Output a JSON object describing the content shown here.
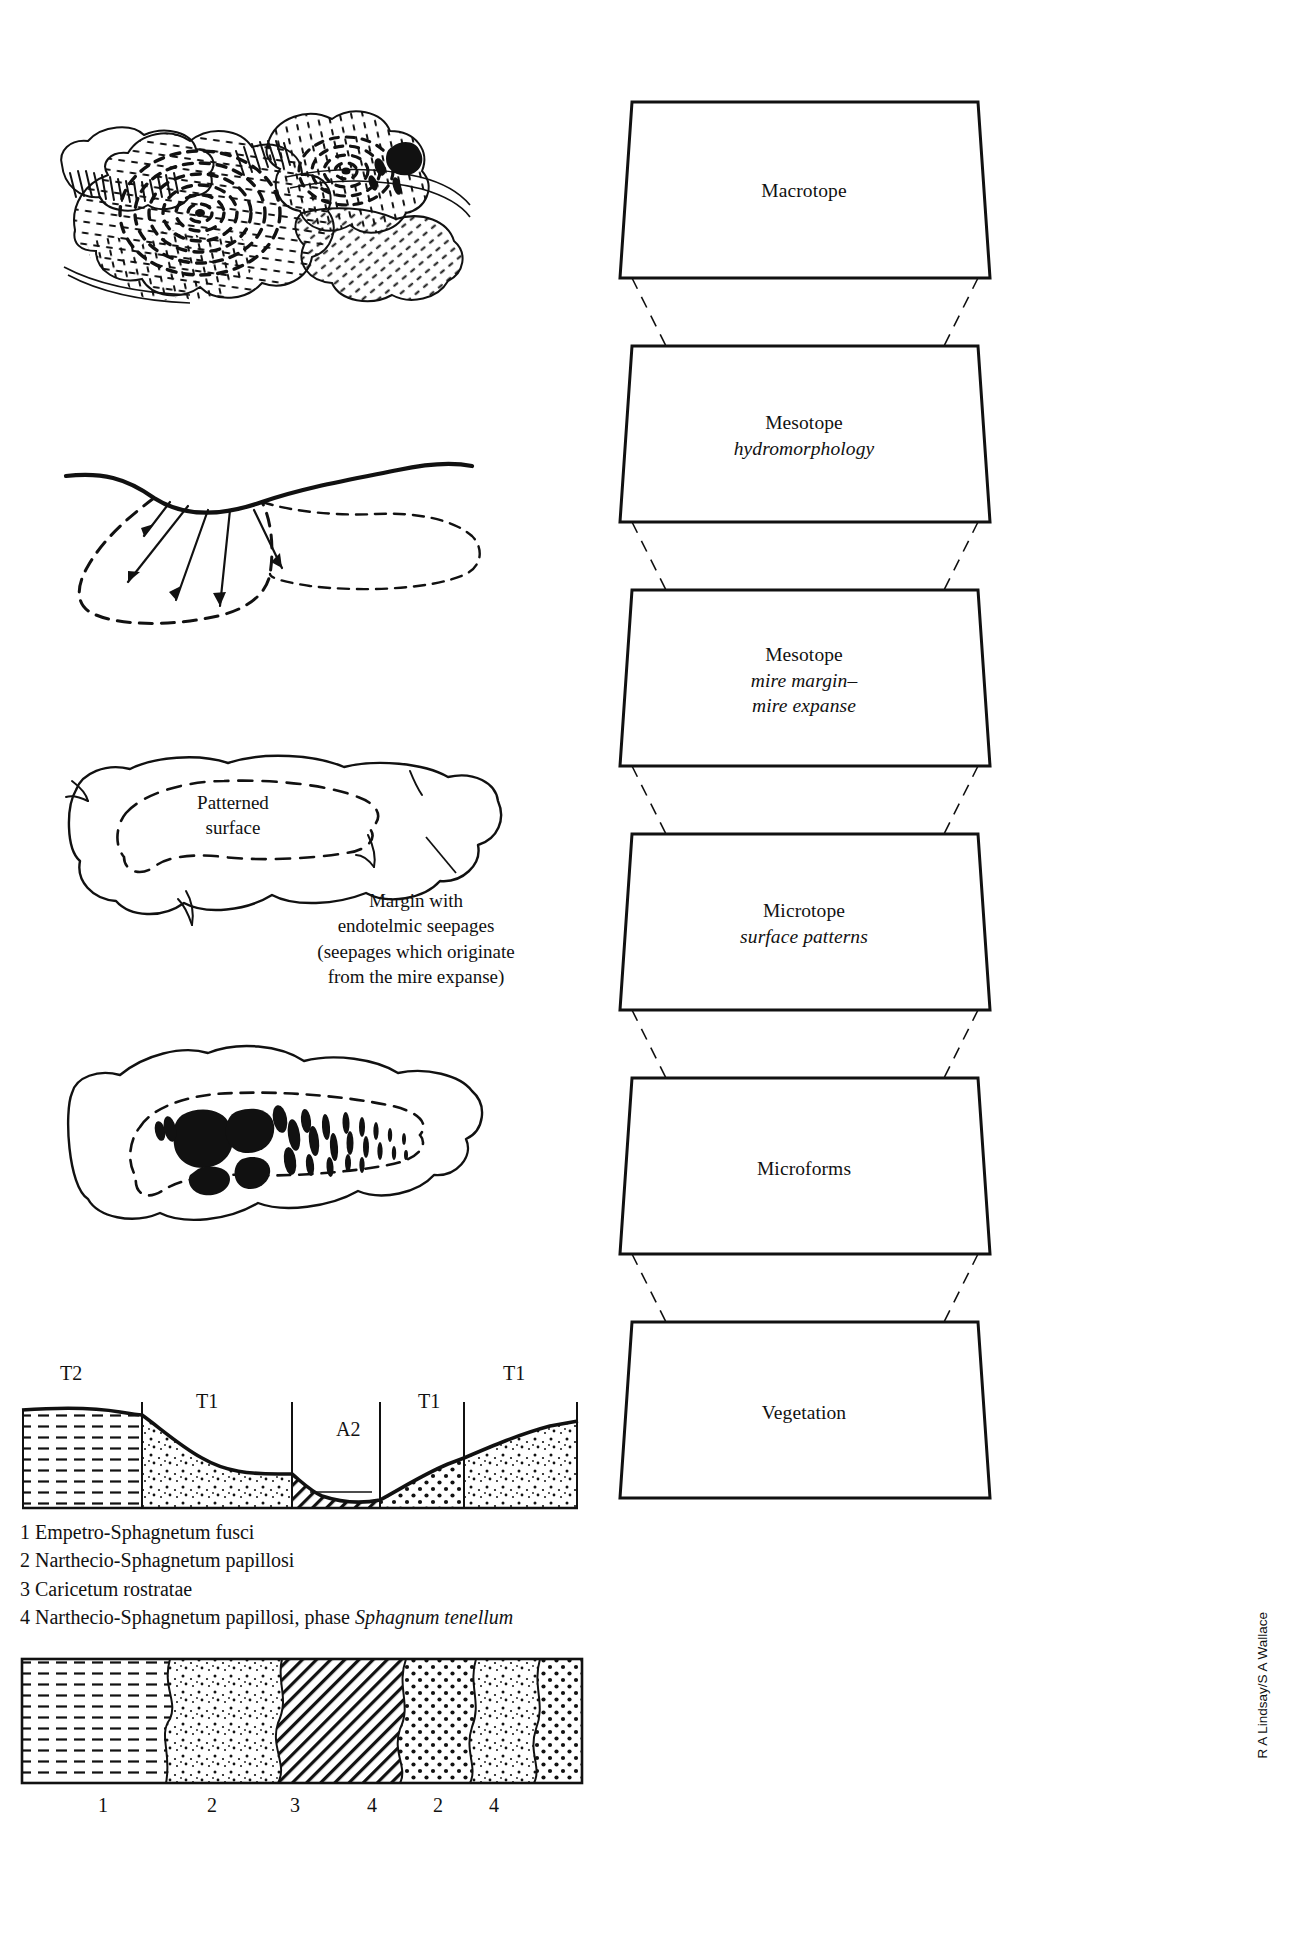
{
  "pyramid": {
    "levels": [
      {
        "title": "Macrotope",
        "subtitle": ""
      },
      {
        "title": "Mesotope",
        "subtitle": "hydromorphology"
      },
      {
        "title": "Mesotope",
        "subtitle": "mire margin–\nmire expanse"
      },
      {
        "title": "Microtope",
        "subtitle": "surface patterns"
      },
      {
        "title": "Microforms",
        "subtitle": ""
      },
      {
        "title": "Vegetation",
        "subtitle": ""
      }
    ]
  },
  "figures": {
    "mire_complex": {
      "name": "mire complex map"
    },
    "hydromorphology": {
      "name": "water flow section"
    },
    "patterned_surface": {
      "inner_label_line1": "Patterned",
      "inner_label_line2": "surface",
      "margin_note_line1": "Margin with",
      "margin_note_line2": "endotelmic seepages",
      "margin_note_line3": "(seepages which originate",
      "margin_note_line4": "from the mire expanse)"
    },
    "microforms": {
      "name": "pool microform map"
    },
    "cross_section": {
      "labels": [
        {
          "text": "T2",
          "x": 62,
          "y": 1368
        },
        {
          "text": "T1",
          "x": 196,
          "y": 1398
        },
        {
          "text": "A2",
          "x": 341,
          "y": 1428
        },
        {
          "text": "T1",
          "x": 418,
          "y": 1398
        },
        {
          "text": "T1",
          "x": 500,
          "y": 1368
        }
      ]
    },
    "vegetation_strip": {
      "numbers": [
        "1",
        "2",
        "3",
        "4",
        "2",
        "4"
      ]
    }
  },
  "legend": {
    "items": [
      {
        "n": "1",
        "text": "Empetro-Sphagnetum fusci",
        "italic": ""
      },
      {
        "n": "2",
        "text": "Narthecio-Sphagnetum papillosi",
        "italic": ""
      },
      {
        "n": "3",
        "text": "Caricetum rostratae",
        "italic": ""
      },
      {
        "n": "4",
        "text": "Narthecio-Sphagnetum papillosi, phase ",
        "italic": "Sphagnum tenellum"
      }
    ]
  },
  "credit": {
    "text": "R A Lindsay/S A Wallace"
  },
  "colors": {
    "ink": "#111111",
    "line": "#000000",
    "paper": "#ffffff"
  }
}
